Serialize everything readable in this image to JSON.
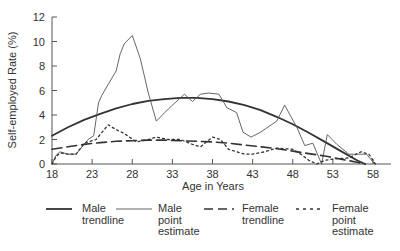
{
  "chart_data": {
    "type": "line",
    "title": "",
    "xlabel": "Age in Years",
    "ylabel": "Self-employed Rate (%)",
    "xlim": [
      18,
      60
    ],
    "ylim": [
      0,
      12
    ],
    "x_ticks": [
      18,
      23,
      28,
      33,
      38,
      43,
      48,
      53,
      58
    ],
    "y_ticks": [
      0,
      2,
      4,
      6,
      8,
      10,
      12
    ],
    "grid": false,
    "legend_position": "bottom",
    "series": [
      {
        "name": "Male trendline",
        "style": "solid-thick",
        "color": "#333333",
        "points": [
          [
            18,
            2.3
          ],
          [
            20,
            3.0
          ],
          [
            22,
            3.6
          ],
          [
            24,
            4.1
          ],
          [
            26,
            4.55
          ],
          [
            28,
            4.9
          ],
          [
            30,
            5.15
          ],
          [
            32,
            5.3
          ],
          [
            34,
            5.4
          ],
          [
            36,
            5.4
          ],
          [
            38,
            5.3
          ],
          [
            40,
            5.1
          ],
          [
            42,
            4.8
          ],
          [
            44,
            4.4
          ],
          [
            46,
            3.85
          ],
          [
            48,
            3.25
          ],
          [
            50,
            2.55
          ],
          [
            52,
            1.8
          ],
          [
            54,
            1.05
          ],
          [
            56,
            0.3
          ],
          [
            57,
            0.0
          ]
        ]
      },
      {
        "name": "Male point estimate",
        "style": "solid-thin",
        "color": "#555555",
        "points": [
          [
            18,
            0.0
          ],
          [
            18.5,
            0.7
          ],
          [
            19,
            1.0
          ],
          [
            20,
            0.8
          ],
          [
            21,
            0.8
          ],
          [
            22,
            1.6
          ],
          [
            22.5,
            2.0
          ],
          [
            23.2,
            2.3
          ],
          [
            23.8,
            5.0
          ],
          [
            24.2,
            5.6
          ],
          [
            25,
            6.5
          ],
          [
            26,
            7.6
          ],
          [
            26.5,
            9.0
          ],
          [
            27,
            9.8
          ],
          [
            28,
            10.5
          ],
          [
            29,
            8.6
          ],
          [
            30,
            5.8
          ],
          [
            31,
            3.5
          ],
          [
            32.5,
            4.5
          ],
          [
            34.5,
            5.7
          ],
          [
            35.5,
            5.1
          ],
          [
            36.5,
            5.7
          ],
          [
            37.5,
            5.8
          ],
          [
            38.8,
            5.7
          ],
          [
            39.8,
            4.6
          ],
          [
            41,
            4.2
          ],
          [
            41.8,
            2.6
          ],
          [
            42.8,
            2.2
          ],
          [
            44,
            2.6
          ],
          [
            46,
            3.5
          ],
          [
            47,
            4.8
          ],
          [
            48.5,
            3.0
          ],
          [
            49.5,
            1.5
          ],
          [
            50.5,
            1.7
          ],
          [
            51.6,
            0.0
          ],
          [
            52.3,
            2.4
          ],
          [
            53.5,
            1.6
          ],
          [
            55,
            0.8
          ],
          [
            57.2,
            0.8
          ],
          [
            58.2,
            0.0
          ]
        ]
      },
      {
        "name": "Female trendline",
        "style": "dashed-long",
        "color": "#333333",
        "points": [
          [
            18,
            1.2
          ],
          [
            20,
            1.4
          ],
          [
            22,
            1.6
          ],
          [
            24,
            1.75
          ],
          [
            26,
            1.85
          ],
          [
            28,
            1.9
          ],
          [
            30,
            1.95
          ],
          [
            32,
            1.95
          ],
          [
            34,
            1.9
          ],
          [
            36,
            1.85
          ],
          [
            38,
            1.8
          ],
          [
            40,
            1.7
          ],
          [
            42,
            1.55
          ],
          [
            44,
            1.4
          ],
          [
            46,
            1.25
          ],
          [
            48,
            1.05
          ],
          [
            50,
            0.85
          ],
          [
            52,
            0.65
          ],
          [
            54,
            0.4
          ],
          [
            56,
            0.15
          ],
          [
            57,
            0.0
          ]
        ]
      },
      {
        "name": "Female point estimate",
        "style": "dotted",
        "color": "#333333",
        "points": [
          [
            18,
            0.0
          ],
          [
            18.5,
            0.6
          ],
          [
            19,
            0.9
          ],
          [
            20,
            0.8
          ],
          [
            21,
            0.8
          ],
          [
            22,
            1.7
          ],
          [
            23.5,
            2.0
          ],
          [
            25,
            3.2
          ],
          [
            26,
            2.8
          ],
          [
            27,
            2.5
          ],
          [
            28.5,
            1.8
          ],
          [
            30,
            2.0
          ],
          [
            31,
            2.2
          ],
          [
            32.5,
            2.0
          ],
          [
            34,
            2.0
          ],
          [
            35.5,
            1.6
          ],
          [
            36.5,
            1.4
          ],
          [
            38,
            2.2
          ],
          [
            39,
            2.0
          ],
          [
            40,
            1.2
          ],
          [
            41,
            1.0
          ],
          [
            42,
            0.8
          ],
          [
            43,
            0.8
          ],
          [
            44.5,
            1.0
          ],
          [
            46,
            1.3
          ],
          [
            48,
            1.2
          ],
          [
            49,
            0.8
          ],
          [
            50,
            0.3
          ],
          [
            51,
            0.0
          ],
          [
            52,
            0.3
          ],
          [
            53,
            0.4
          ],
          [
            55,
            0.5
          ],
          [
            56.5,
            1.0
          ],
          [
            57.5,
            0.8
          ],
          [
            58.3,
            0.0
          ]
        ]
      }
    ]
  },
  "axes": {
    "y_label": "Self-employed Rate (%)",
    "x_label": "Age in Years",
    "y_tick_labels": [
      "0",
      "2",
      "4",
      "6",
      "8",
      "10",
      "12"
    ],
    "x_tick_labels": [
      "18",
      "23",
      "28",
      "33",
      "38",
      "43",
      "48",
      "53",
      "58"
    ]
  },
  "legend": {
    "items": [
      {
        "label": "Male\ntrendline"
      },
      {
        "label": "Male\npoint\nestimate"
      },
      {
        "label": "Female\ntrendline"
      },
      {
        "label": "Female\npoint\nestimate"
      }
    ]
  }
}
